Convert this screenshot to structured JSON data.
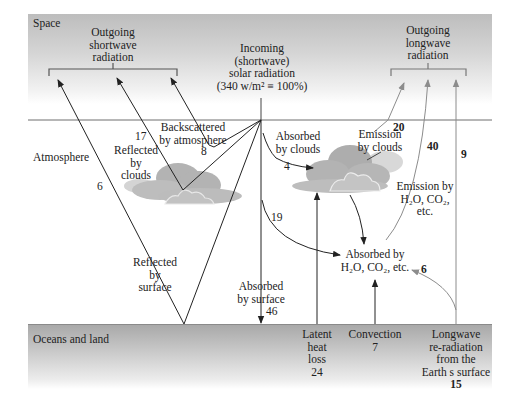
{
  "zones": {
    "space": "Space",
    "atmosphere": "Atmosphere",
    "surface": "Oceans and land"
  },
  "incoming": {
    "line1": "Incoming",
    "line2": "(shortwave)",
    "line3": "solar radiation",
    "line4": "(340 w/m² ≡ 100%)"
  },
  "outgoing_shortwave": {
    "line1": "Outgoing",
    "line2": "shortwave",
    "line3": "radiation"
  },
  "outgoing_longwave": {
    "line1": "Outgoing",
    "line2": "longwave",
    "line3": "radiation"
  },
  "flows": {
    "backscattered": {
      "line1": "Backscattered",
      "line2": "by atmosphere",
      "value": "8"
    },
    "reflected_clouds": {
      "line1": "Reflected",
      "line2": "by",
      "line3": "clouds",
      "value": "17"
    },
    "reflected_surface": {
      "line1": "Reflected",
      "line2": "by",
      "line3": "surface",
      "value": "6"
    },
    "absorbed_clouds": {
      "line1": "Absorbed",
      "line2": "by clouds",
      "value": "4"
    },
    "absorbed_atmos_direct": {
      "value": "19"
    },
    "absorbed_surface": {
      "line1": "Absorbed",
      "line2": "by surface",
      "value": "46"
    },
    "emission_clouds": {
      "line1": "Emission",
      "line2": "by clouds",
      "value": "20"
    },
    "emission_gases": {
      "line1": "Emission by",
      "line2": "H₂O, CO₂,",
      "line3": "etc.",
      "value": "40"
    },
    "surface_to_space": {
      "value": "9"
    },
    "absorbed_gases": {
      "line1": "Absorbed by",
      "line2": "H₂O, CO₂, etc.",
      "value": "6"
    },
    "latent_heat": {
      "line1": "Latent",
      "line2": "heat",
      "line3": "loss",
      "value": "24"
    },
    "convection": {
      "line1": "Convection",
      "value": "7"
    },
    "longwave_reradiation": {
      "line1": "Longwave",
      "line2": "re-radiation",
      "line3": "from the",
      "line4": "Earth s surface",
      "value": "15"
    }
  },
  "colors": {
    "dark_arrow": "#222222",
    "gray_arrow": "#8c8c8c",
    "cloud_fill": "#b3b3b3",
    "cloud_light": "#d4d4d4"
  }
}
